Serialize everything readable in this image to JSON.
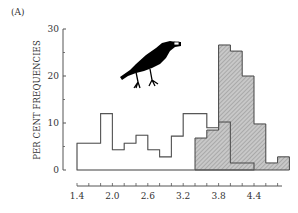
{
  "panel_label": "(A)",
  "chart_data": {
    "type": "bar",
    "title": "",
    "panel": "(A)",
    "xlabel": "",
    "ylabel": "PER CENT FREQUENCIES",
    "xlim": [
      1.4,
      5.0
    ],
    "ylim": [
      0,
      30
    ],
    "x_ticks": [
      1.4,
      2.0,
      2.6,
      3.2,
      3.8,
      4.4
    ],
    "x_tick_labels": [
      "1.4",
      "2.0",
      "2.6",
      "3.2",
      "3.8",
      "4.4"
    ],
    "x_minor_tick_step": 0.2,
    "y_ticks": [
      0,
      10,
      20,
      30
    ],
    "y_tick_labels": [
      "0",
      "10",
      "20",
      "30"
    ],
    "y_minor_ticks": [
      5,
      15,
      25
    ],
    "bin_width": 0.2,
    "grid": false,
    "legend": null,
    "annotation": "crow silhouette holding a whelk shell in its beak",
    "series": [
      {
        "name": "available (open bars)",
        "style": "open",
        "bin_start": 1.4,
        "bins": [
          1.4,
          1.6,
          1.8,
          2.0,
          2.2,
          2.4,
          2.6,
          2.8,
          3.0,
          3.2,
          3.4,
          3.6,
          3.8,
          4.0,
          4.2
        ],
        "values": [
          5.7,
          5.7,
          12.0,
          4.3,
          5.7,
          7.4,
          4.3,
          2.8,
          7.2,
          12.0,
          12.0,
          9.0,
          10.2,
          1.5,
          1.5
        ]
      },
      {
        "name": "selected (hatched bars)",
        "style": "hatched",
        "bin_start": 3.4,
        "bins": [
          3.4,
          3.6,
          3.8,
          4.0,
          4.2,
          4.4,
          4.6,
          4.8
        ],
        "values": [
          6.8,
          8.5,
          26.6,
          25.3,
          20.0,
          9.8,
          1.5,
          2.8
        ]
      }
    ]
  },
  "colors": {
    "axis": "#555555",
    "open_outline": "#666666",
    "hatch_fill": "#c8c8c8",
    "hatch_line": "#8a8a8a",
    "hatch_outline": "#444444",
    "crow": "#000000"
  }
}
